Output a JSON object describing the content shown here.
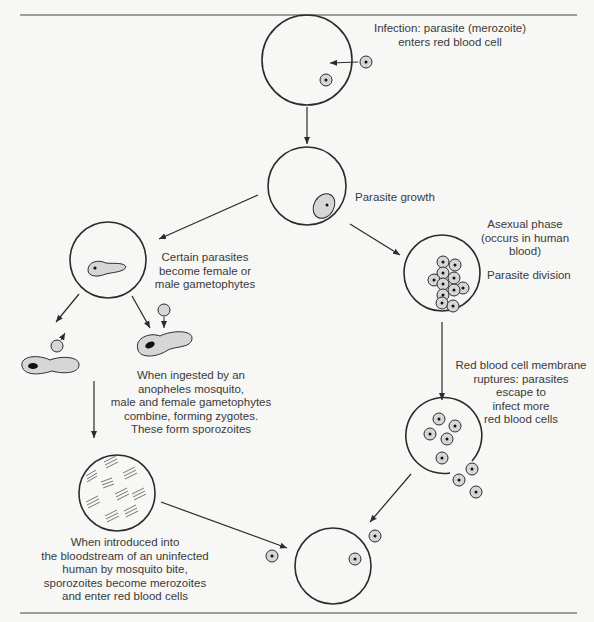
{
  "diagram": {
    "colors": {
      "stroke": "#2b2b2b",
      "cell_fill": "#d6d6d6",
      "background": "#f7f7f5"
    },
    "stages": [
      {
        "id": "infection",
        "label": "Infection: parasite (merozoite)\nenters red blood cell"
      },
      {
        "id": "growth",
        "label": "Parasite growth"
      },
      {
        "id": "asexual",
        "label": "Asexual phase\n(occurs in human\nblood)"
      },
      {
        "id": "division",
        "label": "Parasite division"
      },
      {
        "id": "rupture",
        "label": "Red blood cell membrane\nruptures: parasites\nescape to\ninfect more\nred blood cells"
      },
      {
        "id": "gametophytes",
        "label": "Certain parasites\nbecome female or\nmale gametophytes"
      },
      {
        "id": "mosquito",
        "label": "When ingested by an\nanopheles mosquito,\nmale and female gametophytes\ncombine, forming zygotes.\nThese form sporozoites"
      },
      {
        "id": "introduction",
        "label": "When introduced into\nthe bloodstream of an uninfected\nhuman by mosquito bite,\nsporozoites become merozoites\nand enter red blood cells"
      }
    ]
  }
}
